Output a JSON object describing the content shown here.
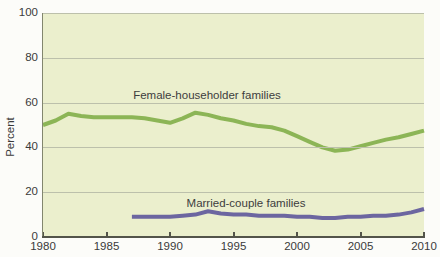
{
  "chart": {
    "ylabel": "Percent",
    "female_label": "Female-householder families",
    "married_label": "Married-couple families"
  },
  "chart_data": {
    "type": "line",
    "title": "",
    "xlabel": "",
    "ylabel": "Percent",
    "xlim": [
      1980,
      2010
    ],
    "ylim": [
      0,
      100
    ],
    "yticks": [
      0,
      20,
      40,
      60,
      80,
      100
    ],
    "xticks": [
      1980,
      1985,
      1990,
      1995,
      2000,
      2005,
      2010
    ],
    "grid": "horizontal",
    "legend": "inline-labels",
    "plot_background": "#ebefcd",
    "series": [
      {
        "name": "Female-householder families",
        "color": "#8cb556",
        "x": [
          1980,
          1981,
          1982,
          1983,
          1984,
          1985,
          1986,
          1987,
          1988,
          1989,
          1990,
          1991,
          1992,
          1993,
          1994,
          1995,
          1996,
          1997,
          1998,
          1999,
          2000,
          2001,
          2002,
          2003,
          2004,
          2005,
          2006,
          2007,
          2008,
          2009,
          2010
        ],
        "values": [
          50,
          52,
          55,
          54,
          53.5,
          53.5,
          53.5,
          53.5,
          53,
          52,
          51,
          53,
          55.5,
          54.5,
          53,
          52,
          50.5,
          49.5,
          49,
          47.5,
          45,
          42.5,
          40,
          38.5,
          39,
          40.5,
          42,
          43.5,
          44.5,
          46,
          47.5
        ]
      },
      {
        "name": "Married-couple families",
        "color": "#6c66a0",
        "x": [
          1987,
          1988,
          1989,
          1990,
          1991,
          1992,
          1993,
          1994,
          1995,
          1996,
          1997,
          1998,
          1999,
          2000,
          2001,
          2002,
          2003,
          2004,
          2005,
          2006,
          2007,
          2008,
          2009,
          2010
        ],
        "values": [
          9,
          9,
          9,
          9,
          9.5,
          10,
          11.5,
          10.5,
          10,
          10,
          9.5,
          9.5,
          9.5,
          9,
          9,
          8.5,
          8.5,
          9,
          9,
          9.5,
          9.5,
          10,
          11,
          12.5
        ]
      }
    ]
  }
}
